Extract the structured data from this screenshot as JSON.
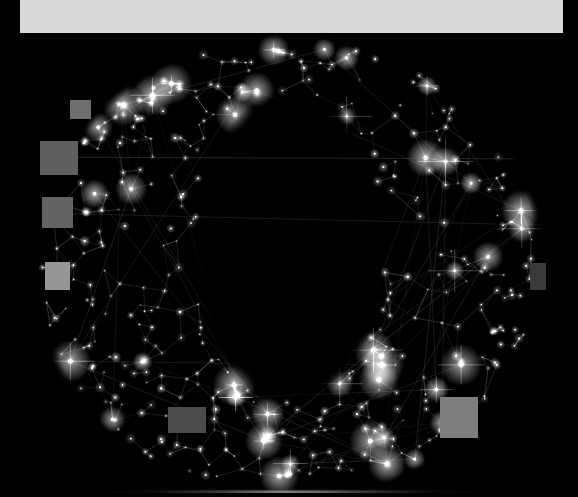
{
  "image": {
    "title": "Constellation letter O",
    "description": "A capital letter O rendered as a star-field network graph: bright point-like stars joined by thin straight lines forming a triangulated mesh over a black background.",
    "width": 578,
    "height": 497,
    "background_color": "#000000",
    "star_color": "#ffffff",
    "line_color": "#b8b8b8",
    "glyph": "O"
  },
  "artwork": {
    "type": "network-constellation",
    "letterform": {
      "name": "letter-O-ring",
      "center_x": 289,
      "center_y": 268,
      "outer_radius_x": 253,
      "outer_radius_y": 232,
      "inner_radius_x": 92,
      "inner_radius_y": 152,
      "inner_center_x": 291,
      "inner_center_y": 247,
      "inner_fill": "#000000"
    },
    "node_count": 430,
    "edge_count": 760,
    "bright_node_count": 46,
    "seed": 20240917
  },
  "occlusions": {
    "label": "gray redaction patches",
    "patches": [
      {
        "name": "patch-top-left",
        "x": 70,
        "y": 100,
        "w": 21,
        "h": 19,
        "color": "#6e6e6e"
      },
      {
        "name": "patch-upper-left",
        "x": 40,
        "y": 141,
        "w": 38,
        "h": 34,
        "color": "#5f5f5f"
      },
      {
        "name": "patch-mid-left",
        "x": 42,
        "y": 197,
        "w": 31,
        "h": 31,
        "color": "#636363"
      },
      {
        "name": "patch-lower-left",
        "x": 45,
        "y": 262,
        "w": 25,
        "h": 28,
        "color": "#969696"
      },
      {
        "name": "patch-bottom-center",
        "x": 168,
        "y": 407,
        "w": 38,
        "h": 26,
        "color": "#4a4a4a"
      },
      {
        "name": "patch-bottom-right",
        "x": 440,
        "y": 397,
        "w": 38,
        "h": 41,
        "color": "#7d7d7d"
      },
      {
        "name": "patch-right-edge",
        "x": 530,
        "y": 263,
        "w": 16,
        "h": 27,
        "color": "#3a3a3a"
      }
    ]
  },
  "topbar": {
    "name": "white-header-band",
    "x": 18,
    "y": 0,
    "w": 545,
    "h": 33,
    "color": "#d9d9d9"
  },
  "bottom_reflection": {
    "name": "floor-reflection-line",
    "y": 489,
    "height": 6,
    "color": "#9a9a9a"
  },
  "scanlines": [
    {
      "name": "scanline-upper",
      "y": 157,
      "opacity": 0.3
    },
    {
      "name": "scanline-diagonal",
      "y": 212,
      "opacity": 0.22
    }
  ]
}
